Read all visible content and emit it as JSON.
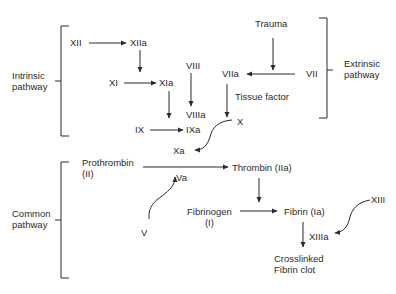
{
  "diagram": {
    "type": "flowchart",
    "groups": {
      "intrinsic": "Intrinsic\npathway",
      "extrinsic": "Extrinsic\npathway",
      "common": "Common\npathway"
    },
    "nodes": {
      "xii": "XII",
      "xiia": "XIIa",
      "xi": "XI",
      "xia": "XIa",
      "viii": "VIII",
      "viiia": "VIIIa",
      "ix": "IX",
      "ixa": "IXa",
      "trauma": "Trauma",
      "vii": "VII",
      "viia": "VIIa",
      "tissue_factor": "Tissue factor",
      "x": "X",
      "xa": "Xa",
      "prothrombin": "Prothrombin\n(II)",
      "va": "Va",
      "v": "V",
      "thrombin": "Thrombin (IIa)",
      "fibrinogen": "Fibrinogen\n(I)",
      "fibrin": "Fibrin (Ia)",
      "xiii": "XIII",
      "xiiia": "XIIIa",
      "clot": "Crosslinked\nFibrin clot"
    },
    "edges": [
      {
        "from": "XII",
        "to": "XIIa"
      },
      {
        "from": "XIIa",
        "to": "XI"
      },
      {
        "from": "XI",
        "to": "XIa"
      },
      {
        "from": "XIa",
        "to": "IX"
      },
      {
        "from": "VIII",
        "to": "VIIIa"
      },
      {
        "from": "IX",
        "to": "IXa"
      },
      {
        "from": "Trauma",
        "to": "VII"
      },
      {
        "from": "VII",
        "to": "VIIa"
      },
      {
        "from": "VIIa",
        "to": "X",
        "label": "Tissue factor"
      },
      {
        "from": "X",
        "to": "Xa"
      },
      {
        "from": "Prothrombin (II)",
        "to": "Thrombin (IIa)",
        "catalysts": [
          "Xa",
          "Va"
        ]
      },
      {
        "from": "V",
        "to": "Va"
      },
      {
        "from": "Thrombin (IIa)",
        "to": "Fibrinogen → Fibrin"
      },
      {
        "from": "Fibrinogen (I)",
        "to": "Fibrin (Ia)"
      },
      {
        "from": "XIII",
        "to": "XIIIa"
      },
      {
        "from": "Fibrin (Ia)",
        "to": "Crosslinked Fibrin clot",
        "catalyst": "XIIIa"
      }
    ],
    "colors": {
      "ink": "#2b2b2b",
      "background": "#ffffff"
    }
  }
}
